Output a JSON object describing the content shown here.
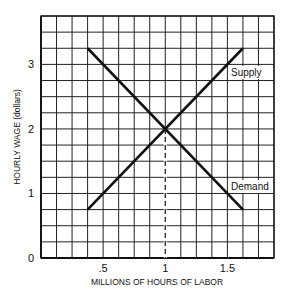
{
  "chart_data": {
    "type": "line",
    "title": "",
    "xlabel": "MILLIONS OF HOURS OF LABOR",
    "ylabel": "HOURLY WAGE (dollars)",
    "xlim": [
      0,
      1.875
    ],
    "ylim": [
      0,
      3.75
    ],
    "x_ticks": [
      {
        "value": 0.5,
        "label": ".5"
      },
      {
        "value": 1,
        "label": "1"
      },
      {
        "value": 1.5,
        "label": "1.5"
      }
    ],
    "y_ticks": [
      {
        "value": 0,
        "label": "0"
      },
      {
        "value": 1,
        "label": "1"
      },
      {
        "value": 2,
        "label": "2"
      },
      {
        "value": 3,
        "label": "3"
      }
    ],
    "grid": {
      "on": true,
      "x_step": 0.125,
      "y_step": 0.25
    },
    "series": [
      {
        "name": "Supply",
        "points": [
          [
            0.375,
            0.75
          ],
          [
            1.625,
            3.25
          ]
        ]
      },
      {
        "name": "Demand",
        "points": [
          [
            0.375,
            3.25
          ],
          [
            1.625,
            0.75
          ]
        ]
      }
    ],
    "annotations": [
      {
        "type": "dashed-vertical",
        "x": 1,
        "from_y": 0,
        "to_y": 2,
        "note": "equilibrium quantity"
      }
    ],
    "equilibrium": {
      "x": 1,
      "y": 2
    }
  },
  "colors": {
    "line": "#111111",
    "grid": "#222222",
    "background": "#ffffff"
  }
}
